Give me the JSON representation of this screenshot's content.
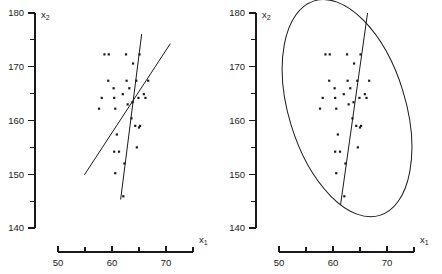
{
  "figure": {
    "background_color": "#ffffff",
    "ink_color": "#1a1a1a",
    "width": 442,
    "height": 274
  },
  "chart_data": [
    {
      "type": "scatter",
      "panel": "left",
      "title": "",
      "subtitle": "",
      "xlabel": "x1",
      "ylabel": "x2",
      "xlabel_display": "x",
      "xlabel_sub": "1",
      "ylabel_display": "x",
      "ylabel_sub": "2",
      "xlim": [
        50,
        75
      ],
      "ylim": [
        140,
        180
      ],
      "grid": false,
      "legend": "none",
      "x_ticks_major": [
        50,
        60,
        70
      ],
      "x_ticks_minor": [
        55,
        65,
        75
      ],
      "x_tick_labels": [
        "50",
        "60",
        "70"
      ],
      "y_ticks_major": [
        140,
        150,
        160,
        170,
        180
      ],
      "y_ticks_minor": [
        145,
        155,
        165,
        175
      ],
      "y_tick_labels": [
        "140",
        "150",
        "160",
        "170",
        "180"
      ],
      "points": [
        [
          58.6,
          172.3
        ],
        [
          59.4,
          172.3
        ],
        [
          62.6,
          172.3
        ],
        [
          65.1,
          172.3
        ],
        [
          63.9,
          170.6
        ],
        [
          59.3,
          167.4
        ],
        [
          62.7,
          167.4
        ],
        [
          64.5,
          167.4
        ],
        [
          66.7,
          167.4
        ],
        [
          60.3,
          166.0
        ],
        [
          63.2,
          166.0
        ],
        [
          58.1,
          164.2
        ],
        [
          60.4,
          164.2
        ],
        [
          64.9,
          164.2
        ],
        [
          66.2,
          164.2
        ],
        [
          62.0,
          164.9
        ],
        [
          65.9,
          164.9
        ],
        [
          57.6,
          162.2
        ],
        [
          60.6,
          162.2
        ],
        [
          62.9,
          163.0
        ],
        [
          63.8,
          163.4
        ],
        [
          63.6,
          160.4
        ],
        [
          64.3,
          159.0
        ],
        [
          65.2,
          159.0
        ],
        [
          65.0,
          158.7
        ],
        [
          60.9,
          157.4
        ],
        [
          64.6,
          155.0
        ],
        [
          60.4,
          154.2
        ],
        [
          61.3,
          154.2
        ],
        [
          62.3,
          152.0
        ],
        [
          60.6,
          150.2
        ],
        [
          62.1,
          145.9
        ]
      ],
      "series": [
        {
          "name": "regression-line-steep",
          "type": "line",
          "x": [
            61.6,
            65.5
          ],
          "y": [
            145.3,
            176.1
          ]
        },
        {
          "name": "regression-line-shallow",
          "type": "line",
          "x": [
            54.9,
            70.8
          ],
          "y": [
            149.9,
            174.3
          ]
        }
      ]
    },
    {
      "type": "scatter",
      "panel": "right",
      "title": "",
      "subtitle": "",
      "xlabel": "x1",
      "ylabel": "x2",
      "xlabel_display": "x",
      "xlabel_sub": "1",
      "ylabel_display": "x",
      "ylabel_sub": "2",
      "xlim": [
        50,
        75
      ],
      "ylim": [
        140,
        180
      ],
      "grid": false,
      "legend": "none",
      "x_ticks_major": [
        50,
        60,
        70
      ],
      "x_ticks_minor": [
        55,
        65,
        75
      ],
      "x_tick_labels": [
        "50",
        "60",
        "70"
      ],
      "y_ticks_major": [
        140,
        150,
        160,
        170,
        180
      ],
      "y_ticks_minor": [
        145,
        155,
        165,
        175
      ],
      "y_tick_labels": [
        "140",
        "150",
        "160",
        "170",
        "180"
      ],
      "points": [
        [
          58.6,
          172.3
        ],
        [
          59.4,
          172.3
        ],
        [
          62.6,
          172.3
        ],
        [
          65.1,
          172.3
        ],
        [
          63.9,
          170.6
        ],
        [
          59.3,
          167.4
        ],
        [
          62.7,
          167.4
        ],
        [
          64.5,
          167.4
        ],
        [
          66.7,
          167.4
        ],
        [
          60.3,
          166.0
        ],
        [
          63.2,
          166.0
        ],
        [
          58.1,
          164.2
        ],
        [
          60.4,
          164.2
        ],
        [
          64.9,
          164.2
        ],
        [
          66.2,
          164.2
        ],
        [
          62.0,
          164.9
        ],
        [
          65.9,
          164.9
        ],
        [
          57.6,
          162.2
        ],
        [
          60.6,
          162.2
        ],
        [
          62.9,
          163.0
        ],
        [
          63.8,
          163.4
        ],
        [
          63.6,
          160.4
        ],
        [
          64.3,
          159.0
        ],
        [
          65.2,
          159.0
        ],
        [
          65.0,
          158.7
        ],
        [
          60.9,
          157.4
        ],
        [
          64.6,
          155.0
        ],
        [
          60.4,
          154.2
        ],
        [
          61.3,
          154.2
        ],
        [
          62.3,
          152.0
        ],
        [
          60.6,
          150.2
        ],
        [
          62.1,
          145.9
        ]
      ],
      "series": [
        {
          "name": "regression-line-steep",
          "type": "line",
          "x": [
            61.4,
            66.4
          ],
          "y": [
            144.3,
            180.0
          ]
        }
      ],
      "ellipse": {
        "name": "concentration-ellipse",
        "center_x": 62.6,
        "center_y": 162.3,
        "semi_major": 19.5,
        "semi_minor": 8.2,
        "rotation_deg": -17
      }
    }
  ]
}
